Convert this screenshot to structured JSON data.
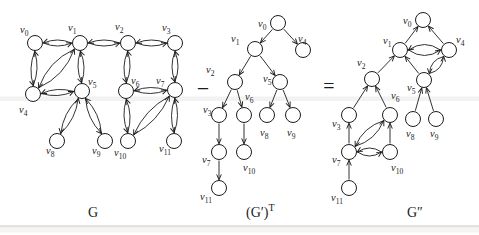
{
  "colors": {
    "ink": "#1c1c1c",
    "background": "#ffffff"
  },
  "operators": [
    {
      "id": "minus-sign",
      "symbol": "−",
      "x": 203,
      "y": 96,
      "size": 22
    },
    {
      "id": "equals-sign",
      "symbol": "=",
      "x": 329,
      "y": 93,
      "size": 20
    }
  ],
  "graphs": [
    {
      "id": "G",
      "caption": {
        "x": 88,
        "y": 217,
        "parts": [
          {
            "text": "G",
            "size": 14,
            "dy": 0
          }
        ]
      },
      "nodes": [
        {
          "id": "v0",
          "base": "v",
          "sub": "0",
          "x": 35,
          "y": 43,
          "lx": 20,
          "ly": 33
        },
        {
          "id": "v1",
          "base": "v",
          "sub": "1",
          "x": 80,
          "y": 43,
          "lx": 68,
          "ly": 31
        },
        {
          "id": "v2",
          "base": "v",
          "sub": "2",
          "x": 128,
          "y": 43,
          "lx": 115,
          "ly": 30
        },
        {
          "id": "v3",
          "base": "v",
          "sub": "3",
          "x": 175,
          "y": 43,
          "lx": 162,
          "ly": 31
        },
        {
          "id": "v4",
          "base": "v",
          "sub": "4",
          "x": 33,
          "y": 94,
          "lx": 19,
          "ly": 113
        },
        {
          "id": "v5",
          "base": "v",
          "sub": "5",
          "x": 82,
          "y": 91,
          "lx": 88,
          "ly": 85
        },
        {
          "id": "v6",
          "base": "v",
          "sub": "6",
          "x": 126,
          "y": 91,
          "lx": 131,
          "ly": 84
        },
        {
          "id": "v7",
          "base": "v",
          "sub": "7",
          "x": 175,
          "y": 90,
          "lx": 156,
          "ly": 84
        },
        {
          "id": "v8",
          "base": "v",
          "sub": "8",
          "x": 57,
          "y": 141,
          "lx": 46,
          "ly": 154
        },
        {
          "id": "v9",
          "base": "v",
          "sub": "9",
          "x": 105,
          "y": 141,
          "lx": 92,
          "ly": 154
        },
        {
          "id": "v10",
          "base": "v",
          "sub": "10",
          "x": 128,
          "y": 141,
          "lx": 114,
          "ly": 156
        },
        {
          "id": "v11",
          "base": "v",
          "sub": "11",
          "x": 174,
          "y": 141,
          "lx": 159,
          "ly": 152
        }
      ],
      "edges": [
        {
          "a": "v0",
          "b": "v1",
          "kind": "pair",
          "bow": 6
        },
        {
          "a": "v1",
          "b": "v2",
          "kind": "pair",
          "bow": 6
        },
        {
          "a": "v2",
          "b": "v3",
          "kind": "pair",
          "bow": 6
        },
        {
          "a": "v0",
          "b": "v4",
          "kind": "pair",
          "bow": 6
        },
        {
          "a": "v1",
          "b": "v5",
          "kind": "pair",
          "bow": 6
        },
        {
          "a": "v2",
          "b": "v6",
          "kind": "pair",
          "bow": 6
        },
        {
          "a": "v3",
          "b": "v7",
          "kind": "pair",
          "bow": 6
        },
        {
          "a": "v1",
          "b": "v4",
          "kind": "pair",
          "bow": 11
        },
        {
          "a": "v4",
          "b": "v5",
          "kind": "pair",
          "bow": 6
        },
        {
          "a": "v6",
          "b": "v7",
          "kind": "pair",
          "bow": 6
        },
        {
          "a": "v5",
          "b": "v8",
          "kind": "pair",
          "bow": 7
        },
        {
          "a": "v5",
          "b": "v9",
          "kind": "pair",
          "bow": 7
        },
        {
          "a": "v6",
          "b": "v10",
          "kind": "pair",
          "bow": 6
        },
        {
          "a": "v7",
          "b": "v11",
          "kind": "pair",
          "bow": 6
        },
        {
          "a": "v7",
          "b": "v10",
          "kind": "pair",
          "bow": 9
        }
      ]
    },
    {
      "id": "G-prime-T",
      "caption": {
        "x": 246,
        "y": 217,
        "parts": [
          {
            "text": "(G′)",
            "size": 14,
            "dy": 0
          },
          {
            "text": "T",
            "size": 10,
            "dy": -6
          }
        ]
      },
      "nodes": [
        {
          "id": "v0",
          "base": "v",
          "sub": "0",
          "x": 278,
          "y": 23,
          "lx": 258,
          "ly": 27
        },
        {
          "id": "v1",
          "base": "v",
          "sub": "1",
          "x": 255,
          "y": 49,
          "lx": 231,
          "ly": 42
        },
        {
          "id": "v2",
          "base": "v",
          "sub": "2",
          "x": 235,
          "y": 82,
          "lx": 206,
          "ly": 73
        },
        {
          "id": "v3",
          "base": "v",
          "sub": "3",
          "x": 219,
          "y": 115,
          "lx": 203,
          "ly": 113
        },
        {
          "id": "v4",
          "base": "v",
          "sub": "4",
          "x": 303,
          "y": 50,
          "lx": 298,
          "ly": 42
        },
        {
          "id": "v5",
          "base": "v",
          "sub": "5",
          "x": 280,
          "y": 82,
          "lx": 263,
          "ly": 82
        },
        {
          "id": "v6",
          "base": "v",
          "sub": "6",
          "x": 244,
          "y": 115,
          "lx": 245,
          "ly": 100
        },
        {
          "id": "v7",
          "base": "v",
          "sub": "7",
          "x": 219,
          "y": 152,
          "lx": 202,
          "ly": 163
        },
        {
          "id": "v8",
          "base": "v",
          "sub": "8",
          "x": 267,
          "y": 115,
          "lx": 260,
          "ly": 136
        },
        {
          "id": "v9",
          "base": "v",
          "sub": "9",
          "x": 293,
          "y": 115,
          "lx": 287,
          "ly": 136
        },
        {
          "id": "v10",
          "base": "v",
          "sub": "10",
          "x": 244,
          "y": 152,
          "lx": 243,
          "ly": 171
        },
        {
          "id": "v11",
          "base": "v",
          "sub": "11",
          "x": 219,
          "y": 188,
          "lx": 200,
          "ly": 200
        }
      ],
      "edges": [
        {
          "a": "v0",
          "b": "v1",
          "kind": "dir"
        },
        {
          "a": "v0",
          "b": "v4",
          "kind": "dir"
        },
        {
          "a": "v1",
          "b": "v2",
          "kind": "dir"
        },
        {
          "a": "v1",
          "b": "v5",
          "kind": "dir"
        },
        {
          "a": "v2",
          "b": "v3",
          "kind": "dir"
        },
        {
          "a": "v2",
          "b": "v6",
          "kind": "dir"
        },
        {
          "a": "v3",
          "b": "v7",
          "kind": "dir"
        },
        {
          "a": "v5",
          "b": "v8",
          "kind": "dir"
        },
        {
          "a": "v5",
          "b": "v9",
          "kind": "dir"
        },
        {
          "a": "v6",
          "b": "v10",
          "kind": "dir"
        },
        {
          "a": "v7",
          "b": "v11",
          "kind": "dir"
        }
      ]
    },
    {
      "id": "G-double-prime",
      "caption": {
        "x": 407,
        "y": 217,
        "parts": [
          {
            "text": "G″",
            "size": 14,
            "dy": 0
          }
        ]
      },
      "nodes": [
        {
          "id": "v0",
          "base": "v",
          "sub": "0",
          "x": 423,
          "y": 20,
          "lx": 403,
          "ly": 24
        },
        {
          "id": "v1",
          "base": "v",
          "sub": "1",
          "x": 400,
          "y": 50,
          "lx": 383,
          "ly": 44
        },
        {
          "id": "v2",
          "base": "v",
          "sub": "2",
          "x": 372,
          "y": 79,
          "lx": 357,
          "ly": 66
        },
        {
          "id": "v3",
          "base": "v",
          "sub": "3",
          "x": 349,
          "y": 115,
          "lx": 332,
          "ly": 127
        },
        {
          "id": "v4",
          "base": "v",
          "sub": "4",
          "x": 449,
          "y": 50,
          "lx": 456,
          "ly": 43
        },
        {
          "id": "v5",
          "base": "v",
          "sub": "5",
          "x": 424,
          "y": 80,
          "lx": 407,
          "ly": 91
        },
        {
          "id": "v6",
          "base": "v",
          "sub": "6",
          "x": 390,
          "y": 115,
          "lx": 391,
          "ly": 99
        },
        {
          "id": "v7",
          "base": "v",
          "sub": "7",
          "x": 349,
          "y": 152,
          "lx": 332,
          "ly": 163
        },
        {
          "id": "v8",
          "base": "v",
          "sub": "8",
          "x": 413,
          "y": 119,
          "lx": 406,
          "ly": 137
        },
        {
          "id": "v9",
          "base": "v",
          "sub": "9",
          "x": 436,
          "y": 119,
          "lx": 430,
          "ly": 137
        },
        {
          "id": "v10",
          "base": "v",
          "sub": "10",
          "x": 390,
          "y": 152,
          "lx": 391,
          "ly": 171
        },
        {
          "id": "v11",
          "base": "v",
          "sub": "11",
          "x": 349,
          "y": 188,
          "lx": 331,
          "ly": 201
        }
      ],
      "edges": [
        {
          "a": "v1",
          "b": "v0",
          "kind": "dir"
        },
        {
          "a": "v4",
          "b": "v0",
          "kind": "dir"
        },
        {
          "a": "v2",
          "b": "v1",
          "kind": "dir"
        },
        {
          "a": "v5",
          "b": "v1",
          "kind": "dir"
        },
        {
          "a": "v3",
          "b": "v2",
          "kind": "dir"
        },
        {
          "a": "v6",
          "b": "v2",
          "kind": "dir"
        },
        {
          "a": "v7",
          "b": "v3",
          "kind": "dir"
        },
        {
          "a": "v8",
          "b": "v5",
          "kind": "dir"
        },
        {
          "a": "v9",
          "b": "v5",
          "kind": "dir"
        },
        {
          "a": "v10",
          "b": "v6",
          "kind": "dir"
        },
        {
          "a": "v11",
          "b": "v7",
          "kind": "dir"
        },
        {
          "a": "v1",
          "b": "v4",
          "kind": "pair",
          "bow": 11
        },
        {
          "a": "v4",
          "b": "v5",
          "kind": "pair",
          "bow": 8
        },
        {
          "a": "v7",
          "b": "v6",
          "kind": "pair",
          "bow": 9
        },
        {
          "a": "v7",
          "b": "v10",
          "kind": "pair",
          "bow": 8
        }
      ]
    }
  ]
}
